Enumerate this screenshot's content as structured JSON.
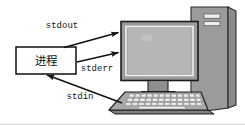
{
  "figure": {
    "width": 245,
    "height": 125,
    "background_color": "#ffffff"
  },
  "process_box": {
    "label": "进程",
    "fill_color": "#ffffff",
    "stroke_color": "#111111"
  },
  "streams": [
    {
      "name": "stdout",
      "label": "stdout",
      "direction": "process-to-computer"
    },
    {
      "name": "stderr",
      "label": "stderr",
      "direction": "process-to-computer"
    },
    {
      "name": "stdin",
      "label": "stdin",
      "direction": "computer-to-process"
    }
  ],
  "computer": {
    "monitor": {
      "bezel_color": "#9b9b9b",
      "screen_color": "#b4b4b4",
      "inner_border_color": "#efefef"
    },
    "tower": {
      "front_color": "#9a9a9a",
      "side_color": "#8a8a8a",
      "drive_bay_count": 2,
      "drive_bay_color": "#e8e8e8"
    },
    "keyboard": {
      "deck_color": "#a6a6a6",
      "key_color": "#ececec",
      "key_rows": 3,
      "keys_per_row": 12,
      "spacebar": true
    },
    "stand_color": "#8f8f8f"
  },
  "arrow_color": "#111111",
  "frame": {
    "bottom_rule_color": "#cfcfcf"
  }
}
